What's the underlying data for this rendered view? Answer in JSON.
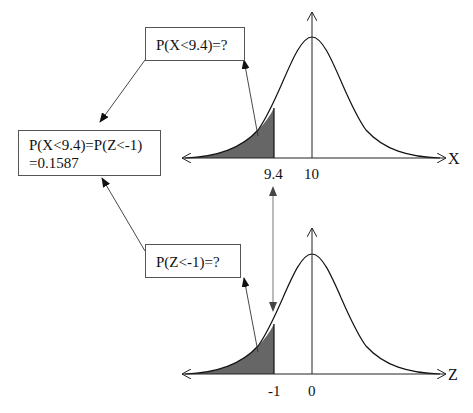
{
  "boxes": {
    "top_question": "P(X<9.4)=?",
    "answer_line1": "P(X<9.4)=P(Z<-1)",
    "answer_line2": "=0.1587",
    "bottom_question": "P(Z<-1)=?"
  },
  "top_curve": {
    "axis_label": "X",
    "ticks": [
      "9.4",
      "10"
    ],
    "mean": 10,
    "cutoff": 9.4
  },
  "bottom_curve": {
    "axis_label": "Z",
    "ticks": [
      "-1",
      "0"
    ],
    "mean": 0,
    "cutoff": -1
  },
  "colors": {
    "shade": "#666666",
    "line": "#222222"
  }
}
